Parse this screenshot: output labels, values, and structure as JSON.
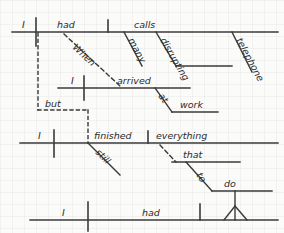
{
  "diagram": {
    "kind": "reed-kellogg-sentence-diagram",
    "ink_color": "#3a3a3a",
    "paper_color": "#fbfbfa",
    "sentence": "When I arrived at work, I had many disrupting telephone calls, but I still finished everything that I had to do.",
    "words": {
      "w_i1": "I",
      "w_had1": "had",
      "w_calls": "calls",
      "w_many": "many",
      "w_disrupting": "disrupting",
      "w_telephone": "telephone",
      "w_when": "When",
      "w_i2": "I",
      "w_arrived": "arrived",
      "w_at": "at",
      "w_work": "work",
      "w_but": "but",
      "w_i3": "I",
      "w_finished": "finished",
      "w_still": "still",
      "w_everything": "everything",
      "w_that": "that",
      "w_to": "to",
      "w_do": "do",
      "w_i4": "I",
      "w_had2": "had"
    },
    "clauses": [
      {
        "name": "main-clause-1",
        "subject": "I",
        "verb": "had",
        "object": "calls",
        "modifiers": [
          "many",
          "disrupting",
          "telephone"
        ]
      },
      {
        "name": "subordinate-clause-when",
        "connector": "When",
        "subject": "I",
        "verb": "arrived",
        "modifiers": [
          "at work"
        ]
      },
      {
        "name": "main-clause-2",
        "conjunction": "but",
        "subject": "I",
        "verb": "finished",
        "object": "everything",
        "modifiers": [
          "still"
        ]
      },
      {
        "name": "relative-clause-that",
        "relative_pronoun": "that",
        "subject": "I",
        "verb": "had",
        "infinitive": "to do"
      }
    ]
  }
}
